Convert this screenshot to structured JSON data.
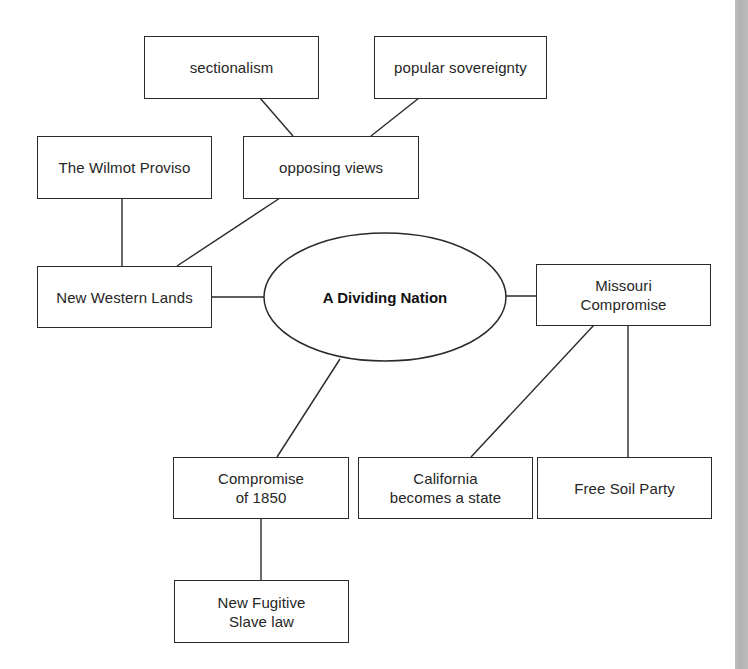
{
  "diagram": {
    "type": "concept-map",
    "center": {
      "label": "A Dividing Nation"
    },
    "nodes": [
      {
        "id": "sectionalism",
        "label": "sectionalism"
      },
      {
        "id": "popular-sovereignty",
        "label": "popular sovereignty"
      },
      {
        "id": "wilmot-proviso",
        "label": "The Wilmot Proviso"
      },
      {
        "id": "opposing-views",
        "label": "opposing views"
      },
      {
        "id": "new-western-lands",
        "label": "New Western Lands"
      },
      {
        "id": "missouri-compromise",
        "label": "Missouri\nCompromise"
      },
      {
        "id": "california-state",
        "label": "California\nbecomes a state"
      },
      {
        "id": "free-soil-party",
        "label": "Free Soil Party"
      },
      {
        "id": "compromise-1850",
        "label": "Compromise\nof 1850"
      },
      {
        "id": "fugitive-slave-law",
        "label": "New Fugitive\nSlave law"
      }
    ],
    "edges": [
      [
        "sectionalism",
        "opposing-views"
      ],
      [
        "popular-sovereignty",
        "opposing-views"
      ],
      [
        "wilmot-proviso",
        "new-western-lands"
      ],
      [
        "opposing-views",
        "new-western-lands"
      ],
      [
        "new-western-lands",
        "center"
      ],
      [
        "center",
        "missouri-compromise"
      ],
      [
        "center",
        "compromise-1850"
      ],
      [
        "missouri-compromise",
        "california-state"
      ],
      [
        "missouri-compromise",
        "free-soil-party"
      ],
      [
        "compromise-1850",
        "fugitive-slave-law"
      ]
    ]
  }
}
